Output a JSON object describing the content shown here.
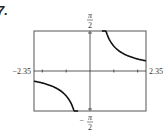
{
  "problem": {
    "number": "7."
  },
  "chart_data": {
    "type": "line",
    "title": "",
    "xlabel": "",
    "ylabel": "",
    "xlim": [
      -2.35,
      2.35
    ],
    "ylim": [
      -1.5708,
      1.5708
    ],
    "x_tick_labels": {
      "left": "−2.35",
      "right": "2.35"
    },
    "y_tick_labels": {
      "top": {
        "num": "π",
        "den": "2",
        "sign": ""
      },
      "bottom": {
        "num": "π",
        "den": "2",
        "sign": "−"
      }
    },
    "x_ticks": [
      -2,
      -1,
      1,
      2
    ],
    "grid": false,
    "legend": null,
    "series": [
      {
        "name": "left-branch",
        "x": [
          -2.35,
          -2.0,
          -1.5,
          -1.0,
          -0.8,
          -0.6,
          -0.5
        ],
        "y": [
          -0.4,
          -0.52,
          -0.73,
          -1.0,
          -1.14,
          -1.32,
          -1.5708
        ]
      },
      {
        "name": "right-branch",
        "x": [
          0.5,
          0.6,
          0.8,
          1.0,
          1.5,
          2.0,
          2.35
        ],
        "y": [
          1.5708,
          1.32,
          1.14,
          1.0,
          0.73,
          0.52,
          0.4
        ]
      }
    ]
  }
}
